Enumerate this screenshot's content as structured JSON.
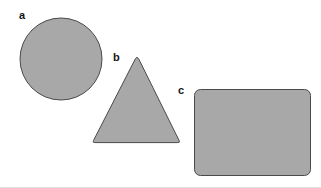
{
  "figure": {
    "background_color": "#ffffff",
    "width": 321,
    "height": 188,
    "baseline_color": "#e2e2e2",
    "shape_fill_color": "#a8a8a8",
    "shape_stroke_color": "#4a4a4a",
    "label_color": "#141414",
    "shapes": [
      {
        "id": "circle",
        "label": "a",
        "kind": "circle",
        "fill": "#a8a8a8",
        "stroke": "#4a4a4a",
        "center_x": 61,
        "center_y": 59,
        "radius": 41
      },
      {
        "id": "triangle",
        "label": "b",
        "kind": "triangle",
        "fill": "#a8a8a8",
        "stroke": "#4a4a4a",
        "apex_x": 138,
        "apex_y": 58,
        "base_left_x": 92,
        "base_right_x": 180,
        "base_y": 142
      },
      {
        "id": "rectangle",
        "label": "c",
        "kind": "rounded-rectangle",
        "fill": "#a8a8a8",
        "stroke": "#4a4a4a",
        "left": 194,
        "top": 89,
        "width": 116,
        "height": 86,
        "corner_radius": 6
      }
    ]
  }
}
